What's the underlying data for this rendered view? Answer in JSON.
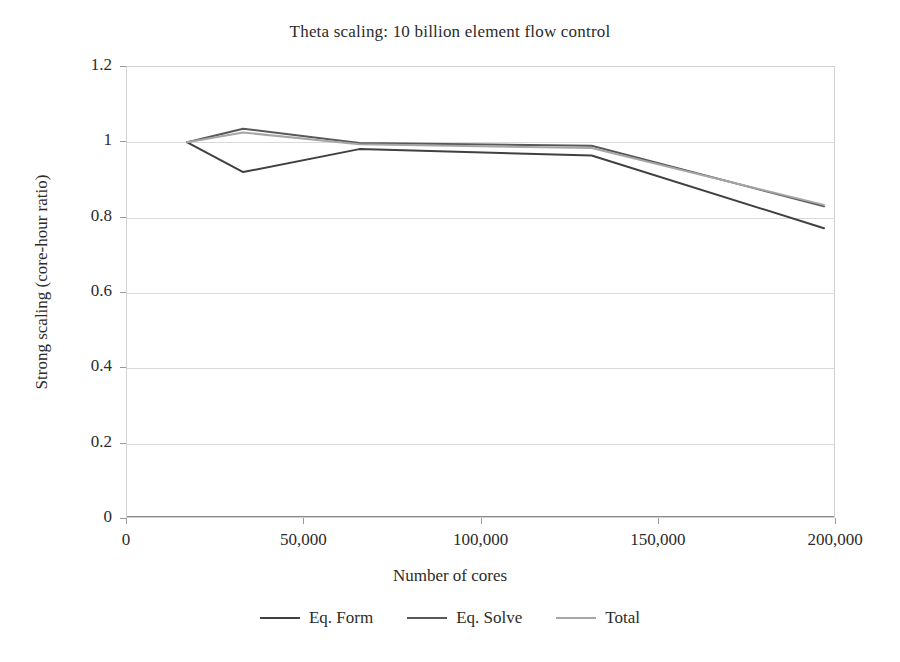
{
  "chart_data": {
    "type": "line",
    "title": "Theta scaling: 10 billion element flow control",
    "xlabel": "Number of cores",
    "ylabel": "Strong scaling (core-hour ratio)",
    "xlim": [
      0,
      200000
    ],
    "ylim": [
      0,
      1.2
    ],
    "xticks": [
      "0",
      "50,000",
      "100,000",
      "150,000",
      "200,000"
    ],
    "xtick_values": [
      0,
      50000,
      100000,
      150000,
      200000
    ],
    "yticks": [
      "0",
      "0.2",
      "0.4",
      "0.6",
      "0.8",
      "1",
      "1.2"
    ],
    "ytick_values": [
      0,
      0.2,
      0.4,
      0.6,
      0.8,
      1,
      1.2
    ],
    "grid": "horizontal",
    "legend_position": "bottom",
    "x": [
      17000,
      32768,
      65536,
      131072,
      196608
    ],
    "series": [
      {
        "name": "Eq. Form",
        "color": "#404040",
        "values": [
          1.0,
          0.921,
          0.982,
          0.965,
          0.772
        ]
      },
      {
        "name": "Eq. Solve",
        "color": "#585858",
        "values": [
          1.0,
          1.036,
          0.998,
          0.991,
          0.83
        ]
      },
      {
        "name": "Total",
        "color": "#a6a6a6",
        "values": [
          1.0,
          1.026,
          0.995,
          0.985,
          0.834
        ]
      }
    ]
  },
  "colors": {
    "axis": "#8a8a8a",
    "grid": "#d9d9d9",
    "text": "#2b2b2b",
    "background": "#ffffff"
  }
}
